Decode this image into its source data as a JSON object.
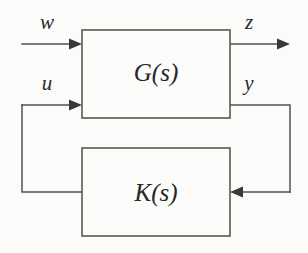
{
  "diagram": {
    "type": "control-system-block-diagram",
    "background_color": "#fbfbfa",
    "line_color": "#555150",
    "text_color": "#2b2b2b",
    "blocks": [
      {
        "id": "plant",
        "label": "G(s)",
        "x": 82,
        "y": 30,
        "width": 148,
        "height": 88
      },
      {
        "id": "controller",
        "label": "K(s)",
        "x": 82,
        "y": 148,
        "width": 148,
        "height": 88
      }
    ],
    "signals": [
      {
        "id": "exogenous-input",
        "label": "w",
        "direction": "into-plant",
        "port": "top-left"
      },
      {
        "id": "performance-output",
        "label": "z",
        "direction": "out-of-plant",
        "port": "top-right"
      },
      {
        "id": "control-input",
        "label": "u",
        "direction": "into-plant",
        "port": "bottom-left"
      },
      {
        "id": "measured-output",
        "label": "y",
        "direction": "out-of-plant",
        "port": "bottom-right"
      }
    ],
    "feedback": {
      "left_path_description": "u from K(s) output up into G(s) lower-left input",
      "right_path_description": "y from G(s) lower-right output down into K(s) right input"
    }
  }
}
